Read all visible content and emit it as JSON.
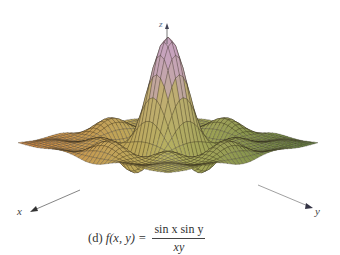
{
  "figure": {
    "caption_prefix": "(d)",
    "caption_lhs": "f(x, y) =",
    "caption_numerator": "sin x sin y",
    "caption_denominator": "xy",
    "axes": {
      "x_label": "x",
      "y_label": "y",
      "z_label": "z"
    }
  },
  "chart_data": {
    "type": "surface3d",
    "function": "sin(x)*sin(y)/(x*y)",
    "xlabel": "x",
    "ylabel": "y",
    "zlabel": "z",
    "x_range": [
      -10,
      10
    ],
    "y_range": [
      -10,
      10
    ],
    "z_range": [
      -0.25,
      1
    ],
    "peak": {
      "x": 0,
      "y": 0,
      "z": 1
    },
    "grid": true,
    "mesh_lines": 40,
    "colormap": [
      "#d9813a",
      "#c9a45a",
      "#b9a88a",
      "#c8a6c0",
      "#a9b86a",
      "#5d7a3a"
    ],
    "legend": null
  }
}
